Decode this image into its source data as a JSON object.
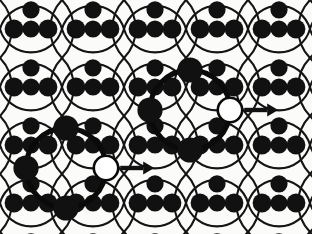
{
  "figure": {
    "title": "Periodic circular-arc lattice with two highlighted motifs",
    "type": "geometric-lattice-diagram",
    "width": 312,
    "height": 234,
    "background_color": "#fbfbfa",
    "ink_color": "#111111",
    "hollow_fill_color": "#ffffff"
  },
  "lattice": {
    "description": "Square lattice of overlapping circular arcs forming vesica/lens cells, with filled circular nodes at lattice sites and cell interiors.",
    "origin_x": 0,
    "origin_y": 0,
    "period_x": 62,
    "period_y": 58,
    "columns": 6,
    "rows": 5,
    "arc_stroke_width": 2.1,
    "arc_color": "#141414",
    "node_radius": 9.4,
    "node_color": "#111111",
    "inner_node_radius": 8.6,
    "site_offset_x": 14,
    "arc_radius_ratio": 0.92
  },
  "motifs": [
    {
      "id": "motif-upper-right",
      "label": "highlighted-ring-1",
      "center_x": 190,
      "center_y": 110,
      "ring_radius": 40,
      "ring_stroke_width": 5.2,
      "ring_color": "#0a0a0a",
      "big_node_radius": 12.6,
      "hollow_node_radius": 12.2,
      "hollow_node_stroke": 2.6,
      "arrow_length": 34,
      "arrow_thickness": 4.4,
      "arrow_head_length": 11,
      "arrow_head_width": 13,
      "arrow_direction": "right",
      "satellite_positions": [
        "north",
        "south",
        "west",
        "east-hollow"
      ]
    },
    {
      "id": "motif-lower-left",
      "label": "highlighted-ring-2",
      "center_x": 66,
      "center_y": 168,
      "ring_radius": 40,
      "ring_stroke_width": 5.2,
      "ring_color": "#0a0a0a",
      "big_node_radius": 12.6,
      "hollow_node_radius": 12.2,
      "hollow_node_stroke": 2.6,
      "arrow_length": 34,
      "arrow_thickness": 4.4,
      "arrow_head_length": 11,
      "arrow_head_width": 13,
      "arrow_direction": "right",
      "satellite_positions": [
        "north",
        "south",
        "west",
        "east-hollow"
      ]
    }
  ],
  "legend": {
    "filled_node": "filled-lattice-node",
    "hollow_node": "vacancy-or-target-site",
    "arrow": "migration-direction",
    "thick_ring": "highlighted-cluster"
  }
}
